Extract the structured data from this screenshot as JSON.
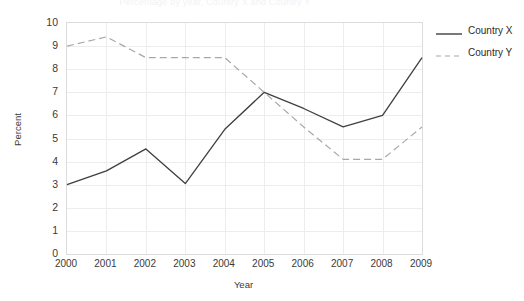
{
  "chart_data": {
    "type": "line",
    "title": "Percentage by year, Country X and Country Y",
    "xlabel": "Year",
    "ylabel": "Percent",
    "categories": [
      "2000",
      "2001",
      "2002",
      "2003",
      "2004",
      "2005",
      "2006",
      "2007",
      "2008",
      "2009"
    ],
    "x": [
      2000,
      2001,
      2002,
      2003,
      2004,
      2005,
      2006,
      2007,
      2008,
      2009
    ],
    "xlim": [
      2000,
      2009
    ],
    "ylim": [
      0,
      10
    ],
    "y_ticks": [
      "10",
      "9",
      "8",
      "7",
      "6",
      "5",
      "4",
      "3",
      "2",
      "1",
      "0"
    ],
    "y_tick_values": [
      10,
      9,
      8,
      7,
      6,
      5,
      4,
      3,
      2,
      1,
      0
    ],
    "grid": true,
    "legend_position": "right",
    "series": [
      {
        "name": "Country X",
        "style": "solid",
        "color": "#3f3f3f",
        "values": [
          3.0,
          3.6,
          4.55,
          3.05,
          5.4,
          7.0,
          6.3,
          5.5,
          6.0,
          8.5
        ]
      },
      {
        "name": "Country Y",
        "style": "dashed",
        "color": "#a8a8a8",
        "values": [
          9.0,
          9.4,
          8.5,
          8.5,
          8.5,
          7.0,
          5.5,
          4.1,
          4.1,
          5.5
        ]
      }
    ]
  },
  "legend": {
    "items": [
      {
        "label": "Country X"
      },
      {
        "label": "Country Y"
      }
    ]
  },
  "colors": {
    "country_x": "#3f3f3f",
    "country_y": "#a8a8a8",
    "grid": "#ededf0",
    "axis": "#dcdcdc",
    "text": "#2b2b2b"
  }
}
